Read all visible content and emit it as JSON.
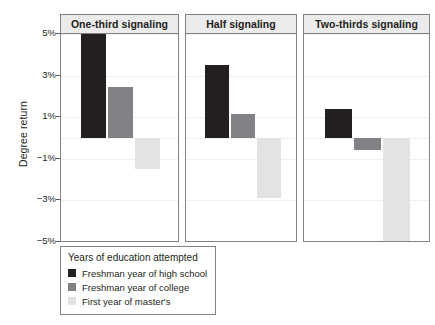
{
  "chart_data": {
    "type": "bar",
    "title": "",
    "xlabel": "",
    "ylabel": "Degree return",
    "ylim": [
      -5,
      5
    ],
    "ytick_labels": [
      "5%",
      "3%",
      "1%",
      "-1%",
      "-3%",
      "-5%"
    ],
    "ytick_values": [
      5,
      3,
      1,
      -1,
      -3,
      -5
    ],
    "grid": true,
    "legend_position": "bottom-left",
    "panel_variable": "Signaling share",
    "panels": [
      "One-third signaling",
      "Half signaling",
      "Two-thirds signaling"
    ],
    "categories": [
      "Freshman year of high school",
      "Freshman year of college",
      "First year of master's"
    ],
    "series": [
      {
        "name": "Freshman year of high school",
        "color": "#231f20",
        "values": [
          5.3,
          3.5,
          1.4
        ]
      },
      {
        "name": "Freshman year of college",
        "color": "#808285",
        "values": [
          2.45,
          1.15,
          -0.6
        ]
      },
      {
        "name": "First year of master's",
        "color": "#e3e3e3",
        "values": [
          -1.5,
          -2.9,
          -5.0
        ]
      }
    ]
  },
  "axis": {
    "y_title": "Degree return",
    "ticks": [
      {
        "label": "5%",
        "value": 5
      },
      {
        "label": "3%",
        "value": 3
      },
      {
        "label": "1%",
        "value": 1
      },
      {
        "label": "−1%",
        "value": -1
      },
      {
        "label": "−3%",
        "value": -3
      },
      {
        "label": "−5%",
        "value": -5
      }
    ]
  },
  "panels": [
    {
      "title": "One-third signaling",
      "bars": [
        {
          "series": "Freshman year of high school",
          "value": 5.3,
          "color": "#231f20"
        },
        {
          "series": "Freshman year of college",
          "value": 2.45,
          "color": "#808285"
        },
        {
          "series": "First year of master's",
          "value": -1.5,
          "color": "#e3e3e3"
        }
      ]
    },
    {
      "title": "Half signaling",
      "bars": [
        {
          "series": "Freshman year of high school",
          "value": 3.5,
          "color": "#231f20"
        },
        {
          "series": "Freshman year of college",
          "value": 1.15,
          "color": "#808285"
        },
        {
          "series": "First year of master's",
          "value": -2.9,
          "color": "#e3e3e3"
        }
      ]
    },
    {
      "title": "Two-thirds signaling",
      "bars": [
        {
          "series": "Freshman year of high school",
          "value": 1.4,
          "color": "#231f20"
        },
        {
          "series": "Freshman year of college",
          "value": -0.6,
          "color": "#808285"
        },
        {
          "series": "First year of master's",
          "value": -5.0,
          "color": "#e3e3e3"
        }
      ]
    }
  ],
  "legend": {
    "title": "Years of education attempted",
    "items": [
      {
        "label": "Freshman year of high school",
        "color": "#231f20"
      },
      {
        "label": "Freshman year of college",
        "color": "#808285"
      },
      {
        "label": "First year of master's",
        "color": "#e3e3e3"
      }
    ]
  }
}
